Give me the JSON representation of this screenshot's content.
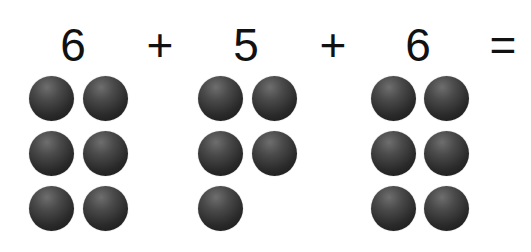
{
  "equation": {
    "terms": [
      {
        "value": "6",
        "count": 6
      },
      {
        "value": "5",
        "count": 5
      },
      {
        "value": "6",
        "count": 6
      }
    ],
    "operators": [
      "+",
      "+"
    ],
    "equals": "="
  },
  "colors": {
    "background": "#ffffff",
    "text": "#111111",
    "ball": "#2a2a2a"
  }
}
